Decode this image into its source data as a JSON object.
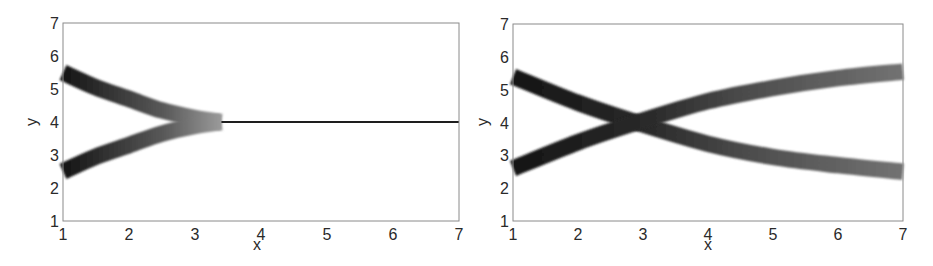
{
  "chart_data": [
    {
      "type": "line",
      "panel": "left",
      "title": "",
      "xlabel": "x",
      "ylabel": "y",
      "xlim": [
        1,
        7
      ],
      "ylim": [
        1,
        7
      ],
      "xticks": [
        "1",
        "2",
        "3",
        "4",
        "5",
        "6",
        "7"
      ],
      "yticks": [
        "1",
        "2",
        "3",
        "4",
        "5",
        "6",
        "7"
      ],
      "grid": false,
      "legend": null,
      "style": "thick shaded bands fading from black to light gray, merging into thin black line",
      "series": [
        {
          "name": "upper branch",
          "x": [
            1.0,
            1.5,
            2.0,
            2.5,
            3.0,
            3.4
          ],
          "y": [
            5.5,
            5.05,
            4.7,
            4.35,
            4.12,
            4.0
          ],
          "band_width": 0.5
        },
        {
          "name": "lower branch",
          "x": [
            1.0,
            1.5,
            2.0,
            2.5,
            3.0,
            3.4
          ],
          "y": [
            2.5,
            2.95,
            3.3,
            3.65,
            3.88,
            4.0
          ],
          "band_width": 0.5
        },
        {
          "name": "merged line",
          "x": [
            3.4,
            7.0
          ],
          "y": [
            4.0,
            4.0
          ],
          "band_width": 0.05
        }
      ]
    },
    {
      "type": "line",
      "panel": "right",
      "title": "",
      "xlabel": "x",
      "ylabel": "y",
      "xlim": [
        1,
        7
      ],
      "ylim": [
        1,
        7
      ],
      "xticks": [
        "1",
        "2",
        "3",
        "4",
        "5",
        "6",
        "7"
      ],
      "yticks": [
        "1",
        "2",
        "3",
        "4",
        "5",
        "6",
        "7"
      ],
      "grid": false,
      "legend": null,
      "style": "thick shaded bands, dark near left, medium gray at right",
      "series": [
        {
          "name": "descending branch",
          "x": [
            1.0,
            2.0,
            2.9,
            4.0,
            5.0,
            6.0,
            7.0
          ],
          "y": [
            5.4,
            4.6,
            4.0,
            3.35,
            2.95,
            2.7,
            2.5
          ],
          "band_width": 0.5
        },
        {
          "name": "ascending branch",
          "x": [
            1.0,
            2.0,
            2.9,
            4.0,
            5.0,
            6.0,
            7.0
          ],
          "y": [
            2.6,
            3.4,
            4.0,
            4.65,
            5.05,
            5.35,
            5.55
          ],
          "band_width": 0.5
        }
      ]
    }
  ],
  "panels": {
    "left": {
      "xlabel": "x",
      "ylabel": "y",
      "xticks": [
        "1",
        "2",
        "3",
        "4",
        "5",
        "6",
        "7"
      ],
      "yticks": [
        "1",
        "2",
        "3",
        "4",
        "5",
        "6",
        "7"
      ]
    },
    "right": {
      "xlabel": "x",
      "ylabel": "y",
      "xticks": [
        "1",
        "2",
        "3",
        "4",
        "5",
        "6",
        "7"
      ],
      "yticks": [
        "1",
        "2",
        "3",
        "4",
        "5",
        "6",
        "7"
      ]
    }
  },
  "colors": {
    "frame": "#8a8a8a",
    "band_dark": "#1a1a1a",
    "band_light": "#d8d8d8",
    "band_right_end": "#6e6e6e",
    "text": "#2a2a2a"
  }
}
